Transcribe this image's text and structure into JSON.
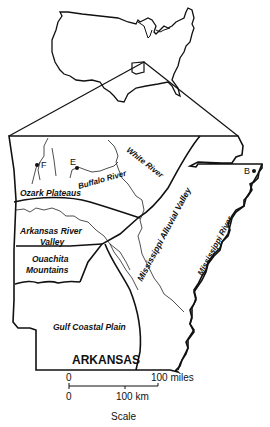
{
  "map": {
    "state_label": "ARKANSAS",
    "regions": [
      {
        "name": "Ozark Plateaus"
      },
      {
        "name": "Arkansas River Valley",
        "lines": [
          "Arkansas River",
          "Valley"
        ]
      },
      {
        "name": "Ouachita Mountains",
        "lines": [
          "Ouachita",
          "Mountains"
        ]
      },
      {
        "name": "Gulf Coastal Plain"
      },
      {
        "name": "Mississippi Alluvial Valley"
      }
    ],
    "rivers": [
      {
        "name": "White River"
      },
      {
        "name": "Buffalo River"
      },
      {
        "name": "Mississippi River"
      }
    ],
    "sites": [
      {
        "label": "E"
      },
      {
        "label": "F"
      },
      {
        "label": "B"
      }
    ],
    "inset": {
      "name": "United States outline"
    }
  },
  "scale": {
    "miles_start": "0",
    "miles_end": "100 miles",
    "km_start": "0",
    "km_end": "100 km",
    "title": "Scale"
  },
  "colors": {
    "ink": "#111111",
    "background": "#ffffff"
  }
}
